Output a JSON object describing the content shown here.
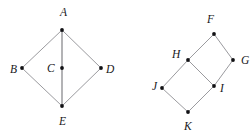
{
  "figure": {
    "background_color": "#ffffff",
    "edge_color": "#8f8f93",
    "vertex_color": "#111114",
    "label_color": "#18181b",
    "diagrams": [
      {
        "name": "kite-quadrilateral-ABDE-with-center-C",
        "vertices": [
          {
            "id": "A",
            "label": "A",
            "cx": 62,
            "cy": 30,
            "label_x": 60,
            "label_y": 16
          },
          {
            "id": "B",
            "label": "B",
            "cx": 22,
            "cy": 68,
            "label_x": 10,
            "label_y": 73
          },
          {
            "id": "C",
            "label": "C",
            "cx": 62,
            "cy": 68,
            "label_x": 47,
            "label_y": 72
          },
          {
            "id": "D",
            "label": "D",
            "cx": 101,
            "cy": 68,
            "label_x": 106,
            "label_y": 73
          },
          {
            "id": "E",
            "label": "E",
            "cx": 62,
            "cy": 106,
            "label_x": 59,
            "label_y": 125
          }
        ],
        "edges": [
          {
            "from": "A",
            "to": "B",
            "weight": "normal"
          },
          {
            "from": "A",
            "to": "D",
            "weight": "normal"
          },
          {
            "from": "B",
            "to": "E",
            "weight": "normal"
          },
          {
            "from": "D",
            "to": "E",
            "weight": "normal"
          },
          {
            "from": "A",
            "to": "E",
            "weight": "strong"
          }
        ]
      },
      {
        "name": "two-adjacent-tilted-squares-FGIH-and-HIKJ",
        "vertices": [
          {
            "id": "F",
            "label": "F",
            "cx": 214,
            "cy": 34,
            "label_x": 207,
            "label_y": 23
          },
          {
            "id": "G",
            "label": "G",
            "cx": 233,
            "cy": 60,
            "label_x": 241,
            "label_y": 64
          },
          {
            "id": "H",
            "label": "H",
            "cx": 188,
            "cy": 60,
            "label_x": 172,
            "label_y": 58
          },
          {
            "id": "I",
            "label": "I",
            "cx": 214,
            "cy": 86,
            "label_x": 220,
            "label_y": 92
          },
          {
            "id": "J",
            "label": "J",
            "cx": 162,
            "cy": 88,
            "label_x": 152,
            "label_y": 90
          },
          {
            "id": "K",
            "label": "K",
            "cx": 188,
            "cy": 112,
            "label_x": 184,
            "label_y": 130
          }
        ],
        "edges": [
          {
            "from": "F",
            "to": "H",
            "weight": "normal"
          },
          {
            "from": "F",
            "to": "G",
            "weight": "normal"
          },
          {
            "from": "G",
            "to": "I",
            "weight": "normal"
          },
          {
            "from": "H",
            "to": "I",
            "weight": "normal"
          },
          {
            "from": "H",
            "to": "J",
            "weight": "normal"
          },
          {
            "from": "J",
            "to": "K",
            "weight": "normal"
          },
          {
            "from": "K",
            "to": "I",
            "weight": "normal"
          }
        ]
      }
    ]
  }
}
